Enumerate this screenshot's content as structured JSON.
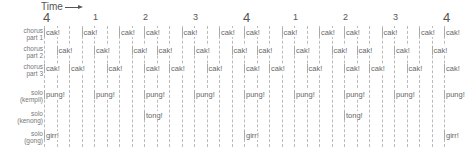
{
  "header": {
    "time_label": "Time",
    "arrow": "right-arrow"
  },
  "grid": {
    "origin_x": 44,
    "step_px": 12.5,
    "subdivisions": 33,
    "top": 26,
    "bottom": 147
  },
  "beats": [
    {
      "label": "4",
      "pos": 0,
      "big": true
    },
    {
      "label": "1",
      "pos": 4,
      "big": false
    },
    {
      "label": "2",
      "pos": 8,
      "big": false
    },
    {
      "label": "3",
      "pos": 12,
      "big": false
    },
    {
      "label": "4",
      "pos": 16,
      "big": true
    },
    {
      "label": "1",
      "pos": 20,
      "big": false
    },
    {
      "label": "2",
      "pos": 24,
      "big": false
    },
    {
      "label": "3",
      "pos": 28,
      "big": false
    },
    {
      "label": "4",
      "pos": 32,
      "big": true
    }
  ],
  "rows": [
    {
      "label": "chorus\npart 1",
      "y": 28,
      "note": "cak!",
      "positions": [
        0,
        3,
        6,
        8,
        11,
        14,
        16,
        19,
        22,
        24,
        27,
        30,
        32
      ]
    },
    {
      "label": "chorus\npart 2",
      "y": 46,
      "note": "cak!",
      "positions": [
        1,
        4,
        7,
        9,
        12,
        15,
        17,
        20,
        23,
        25,
        28,
        31
      ]
    },
    {
      "label": "chorus\npart 3",
      "y": 64,
      "note": "cak!",
      "positions": [
        0,
        2,
        5,
        8,
        10,
        13,
        16,
        18,
        21,
        24,
        26,
        29,
        32
      ]
    },
    {
      "label": "solo\n(kempli)",
      "y": 90,
      "note": "pung!",
      "positions": [
        0,
        4,
        8,
        12,
        16,
        20,
        24,
        28,
        32
      ]
    },
    {
      "label": "solo\n(kenong)",
      "y": 111,
      "note": "tong!",
      "positions": [
        8,
        24
      ]
    },
    {
      "label": "solo\n(gong)",
      "y": 131,
      "note": "girr!",
      "positions": [
        0,
        16,
        32
      ]
    }
  ]
}
